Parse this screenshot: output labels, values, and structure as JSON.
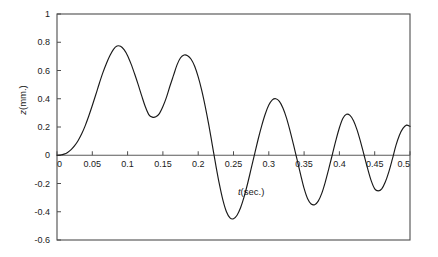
{
  "chart_data": {
    "type": "line",
    "title": "",
    "subtitle": "",
    "xlabel": "t(sec.)",
    "ylabel": "z(mm.)",
    "xlim": [
      0,
      0.5
    ],
    "ylim": [
      -0.6,
      1
    ],
    "grid": false,
    "legend": null,
    "legend_position": "none",
    "xticks": [
      "0",
      "0.05",
      "0.1",
      "0.15",
      "0.2",
      "0.25",
      "0.3",
      "0.35",
      "0.4",
      "0.45",
      "0.5"
    ],
    "xtick_values": [
      0,
      0.05,
      0.1,
      0.15,
      0.2,
      0.25,
      0.3,
      0.35,
      0.4,
      0.45,
      0.5
    ],
    "yticks": [
      "1",
      "0.8",
      "0.6",
      "0.4",
      "0.2",
      "0",
      "-0.2",
      "-0.4",
      "-0.6"
    ],
    "ytick_values": [
      1,
      0.8,
      0.6,
      0.4,
      0.2,
      0,
      -0.2,
      -0.4,
      -0.6
    ],
    "line_color": "#1a1a1a",
    "axis_color": "#4d4d4d",
    "zero_line": 0,
    "annotations": [
      {
        "text": "t(sec.)",
        "x": 0.275,
        "y": -0.28
      }
    ],
    "features": {
      "peaks": [
        {
          "x": 0.077,
          "y": 0.775
        },
        {
          "x": 0.177,
          "y": 0.71
        },
        {
          "x": 0.295,
          "y": 0.4
        },
        {
          "x": 0.395,
          "y": 0.29
        },
        {
          "x": 0.495,
          "y": 0.215
        }
      ],
      "troughs": [
        {
          "x": 0.127,
          "y": 0.27
        },
        {
          "x": 0.243,
          "y": -0.45
        },
        {
          "x": 0.343,
          "y": -0.35
        },
        {
          "x": 0.445,
          "y": -0.25
        }
      ],
      "zero_crossings": [
        0.0,
        0.218,
        0.271,
        0.319,
        0.369,
        0.42,
        0.47
      ]
    },
    "series": [
      {
        "name": "z",
        "x": [
          0,
          0.005,
          0.01,
          0.015,
          0.02,
          0.025,
          0.03,
          0.035,
          0.04,
          0.045,
          0.05,
          0.055,
          0.06,
          0.065,
          0.07,
          0.075,
          0.08,
          0.085,
          0.09,
          0.095,
          0.1,
          0.105,
          0.11,
          0.115,
          0.12,
          0.125,
          0.13,
          0.135,
          0.14,
          0.145,
          0.15,
          0.155,
          0.16,
          0.165,
          0.17,
          0.175,
          0.18,
          0.185,
          0.19,
          0.195,
          0.2,
          0.205,
          0.21,
          0.215,
          0.22,
          0.225,
          0.23,
          0.235,
          0.24,
          0.245,
          0.25,
          0.255,
          0.26,
          0.265,
          0.27,
          0.275,
          0.28,
          0.285,
          0.29,
          0.295,
          0.3,
          0.305,
          0.31,
          0.315,
          0.32,
          0.325,
          0.33,
          0.335,
          0.34,
          0.345,
          0.35,
          0.355,
          0.36,
          0.365,
          0.37,
          0.375,
          0.38,
          0.385,
          0.39,
          0.395,
          0.4,
          0.405,
          0.41,
          0.415,
          0.42,
          0.425,
          0.43,
          0.435,
          0.44,
          0.445,
          0.45,
          0.455,
          0.46,
          0.465,
          0.47,
          0.475,
          0.48,
          0.485,
          0.49,
          0.495,
          0.5
        ],
        "y": [
          0,
          0.002,
          0.008,
          0.02,
          0.04,
          0.068,
          0.105,
          0.152,
          0.21,
          0.278,
          0.352,
          0.43,
          0.51,
          0.585,
          0.65,
          0.706,
          0.75,
          0.773,
          0.772,
          0.748,
          0.705,
          0.645,
          0.575,
          0.5,
          0.42,
          0.345,
          0.288,
          0.27,
          0.272,
          0.295,
          0.345,
          0.41,
          0.49,
          0.565,
          0.64,
          0.69,
          0.71,
          0.705,
          0.68,
          0.63,
          0.555,
          0.46,
          0.345,
          0.215,
          0.072,
          -0.072,
          -0.205,
          -0.318,
          -0.4,
          -0.443,
          -0.45,
          -0.425,
          -0.372,
          -0.295,
          -0.2,
          -0.095,
          0.01,
          0.115,
          0.21,
          0.292,
          0.355,
          0.392,
          0.4,
          0.382,
          0.335,
          0.265,
          0.175,
          0.075,
          -0.03,
          -0.135,
          -0.235,
          -0.308,
          -0.345,
          -0.35,
          -0.325,
          -0.27,
          -0.19,
          -0.095,
          0.005,
          0.105,
          0.195,
          0.262,
          0.29,
          0.282,
          0.245,
          0.18,
          0.095,
          0.0,
          -0.095,
          -0.18,
          -0.238,
          -0.252,
          -0.238,
          -0.19,
          -0.118,
          -0.028,
          0.068,
          0.142,
          0.19,
          0.213,
          0.205
        ]
      }
    ]
  },
  "figure": {
    "background_color": "#ffffff",
    "plot_area": {
      "left": 57,
      "top": 14,
      "right": 410,
      "bottom": 240
    }
  }
}
